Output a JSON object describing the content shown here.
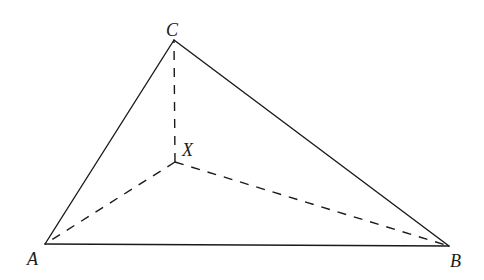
{
  "diagram": {
    "type": "triangle-with-interior-point",
    "stroke_color": "#1a1a1a",
    "background": "#ffffff",
    "points": {
      "A": {
        "label": "A",
        "x": 45,
        "y": 244,
        "label_x": 27,
        "label_y": 265
      },
      "B": {
        "label": "B",
        "x": 449,
        "y": 246,
        "label_x": 450,
        "label_y": 267
      },
      "C": {
        "label": "C",
        "x": 174,
        "y": 40,
        "label_x": 166,
        "label_y": 36
      },
      "X": {
        "label": "X",
        "x": 175,
        "y": 162,
        "label_x": 182,
        "label_y": 156
      }
    },
    "solid_edges": [
      {
        "from": "A",
        "to": "B"
      },
      {
        "from": "B",
        "to": "C"
      },
      {
        "from": "C",
        "to": "A"
      }
    ],
    "dashed_edges": [
      {
        "from": "X",
        "to": "A"
      },
      {
        "from": "X",
        "to": "B"
      },
      {
        "from": "X",
        "to": "C"
      }
    ]
  }
}
